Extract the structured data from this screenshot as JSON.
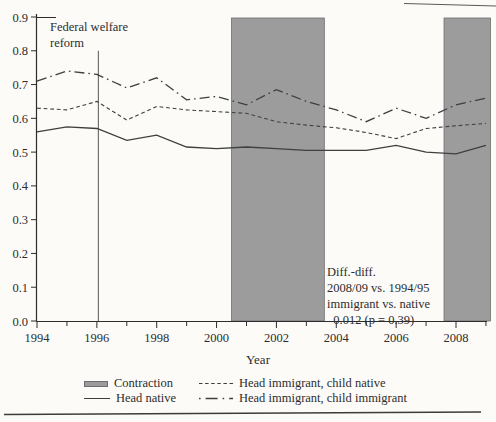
{
  "figure": {
    "background": "#fcfbf8",
    "text_color": "#2d2d2d"
  },
  "chart_data": {
    "type": "line",
    "xlabel": "Year",
    "ylabel": "",
    "x_domain": [
      1994,
      2009.05
    ],
    "ylim": [
      0.0,
      0.9
    ],
    "y_tick_step": 0.1,
    "x_ticks_labeled": [
      1994,
      1996,
      1998,
      2000,
      2002,
      2004,
      2006,
      2008
    ],
    "x_minor_tick_step": 1,
    "grid": "off",
    "legend_position": "bottom",
    "years": [
      1994,
      1995,
      1996,
      1997,
      1998,
      1999,
      2000,
      2001,
      2002,
      2003,
      2004,
      2005,
      2006,
      2007,
      2008,
      2009
    ],
    "series": [
      {
        "name": "Head native",
        "style": "solid",
        "values": [
          0.56,
          0.575,
          0.57,
          0.535,
          0.55,
          0.515,
          0.51,
          0.515,
          0.51,
          0.505,
          0.505,
          0.505,
          0.52,
          0.5,
          0.495,
          0.52
        ]
      },
      {
        "name": "Head immigrant, child native",
        "style": "dashed",
        "values": [
          0.63,
          0.625,
          0.65,
          0.595,
          0.635,
          0.625,
          0.62,
          0.615,
          0.59,
          0.58,
          0.572,
          0.558,
          0.54,
          0.57,
          0.578,
          0.585
        ]
      },
      {
        "name": "Head immigrant, child immigrant",
        "style": "dashdot",
        "values": [
          0.71,
          0.74,
          0.73,
          0.69,
          0.72,
          0.655,
          0.665,
          0.64,
          0.685,
          0.65,
          0.625,
          0.59,
          0.63,
          0.6,
          0.64,
          0.66
        ]
      }
    ],
    "contraction_bands": [
      [
        2000.5,
        2003.6
      ],
      [
        2007.6,
        2009.15
      ]
    ],
    "reform_line": {
      "x_year": 1996.05,
      "top_value": 0.8,
      "label_line1": "Federal welfare",
      "label_line2": "reform"
    },
    "annotation": {
      "lines": [
        "Diff.-diff.",
        "2008/09 vs. 1994/95",
        "immigrant vs. native",
        "–0.012 (p = 0.39)"
      ]
    },
    "colors": {
      "band_fill": "#9c9c9c",
      "band_edge": "#6e6e6e",
      "line": "#3f3f3f",
      "axis": "#2d2d2d",
      "rule": "#3c3c3c"
    }
  },
  "legend": {
    "items": [
      {
        "label": "Contraction",
        "swatch": "band"
      },
      {
        "label": "Head native",
        "swatch": "solid"
      },
      {
        "label": "Head immigrant, child native",
        "swatch": "dashed"
      },
      {
        "label": "Head immigrant, child immigrant",
        "swatch": "dashdot"
      }
    ]
  }
}
